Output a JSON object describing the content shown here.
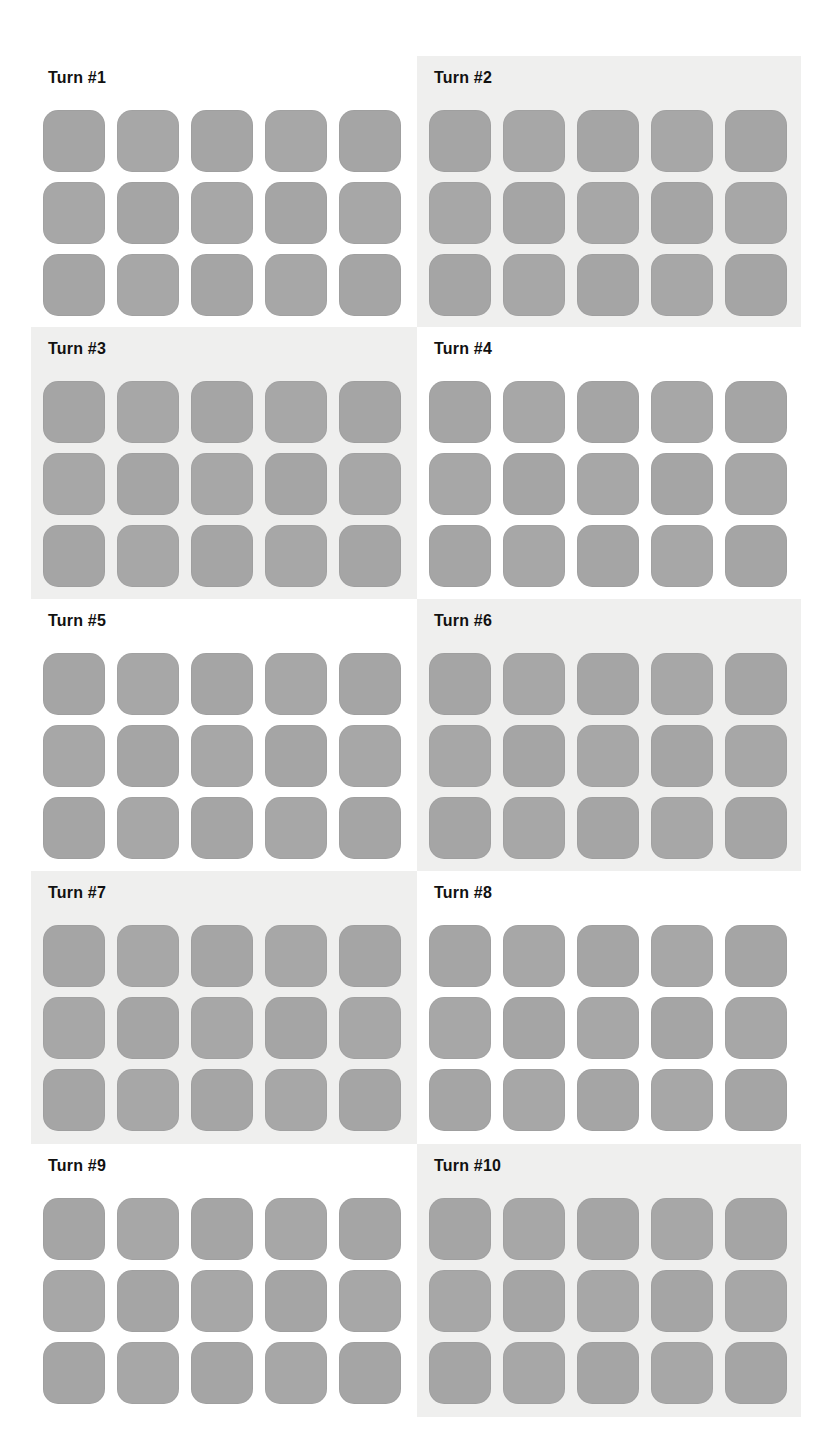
{
  "colors": {
    "page_background": "#ffffff",
    "shaded_panel_background": "#efefee",
    "tile": "#a7a7a7",
    "title_text": "#111111"
  },
  "grid": {
    "columns": 5,
    "rows": 3
  },
  "turns": [
    {
      "label": "Turn #1",
      "shaded": false
    },
    {
      "label": "Turn #2",
      "shaded": true
    },
    {
      "label": "Turn #3",
      "shaded": true
    },
    {
      "label": "Turn #4",
      "shaded": false
    },
    {
      "label": "Turn #5",
      "shaded": false
    },
    {
      "label": "Turn #6",
      "shaded": true
    },
    {
      "label": "Turn #7",
      "shaded": true
    },
    {
      "label": "Turn #8",
      "shaded": false
    },
    {
      "label": "Turn #9",
      "shaded": false
    },
    {
      "label": "Turn #10",
      "shaded": true
    }
  ]
}
